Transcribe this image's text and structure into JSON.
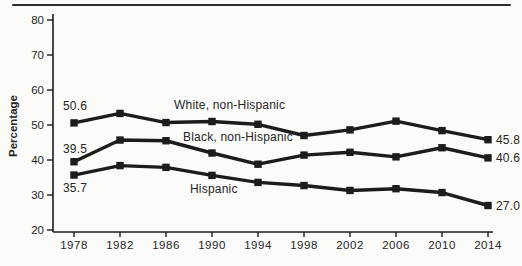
{
  "figure": {
    "background": "#fbfbf9",
    "rule_color": "#2d2d2d",
    "line_color": "#1c1c1c",
    "text_color": "#262626"
  },
  "chart_data": {
    "type": "line",
    "title": "",
    "xlabel": "",
    "ylabel": "Percentage",
    "ylim": [
      20,
      80
    ],
    "yticks": [
      "80",
      "70",
      "60",
      "50",
      "40",
      "30",
      "20"
    ],
    "categories": [
      "1978",
      "1982",
      "1986",
      "1990",
      "1994",
      "1998",
      "2002",
      "2006",
      "2010",
      "2014"
    ],
    "grid": false,
    "legend": "inline-labels",
    "marker": "filled-square",
    "series": [
      {
        "name": "White, non-Hispanic",
        "values": [
          50.6,
          53.3,
          50.7,
          51.0,
          50.2,
          47.0,
          48.6,
          51.1,
          48.4,
          45.8
        ],
        "first_label": "50.6",
        "last_label": "45.8"
      },
      {
        "name": "Black, non-Hispanic",
        "values": [
          39.5,
          45.7,
          45.5,
          42.0,
          38.8,
          41.4,
          42.2,
          40.9,
          43.5,
          40.6
        ],
        "first_label": "39.5",
        "last_label": "40.6"
      },
      {
        "name": "Hispanic",
        "values": [
          35.7,
          38.4,
          37.9,
          35.6,
          33.6,
          32.7,
          31.3,
          31.8,
          30.7,
          27.0
        ],
        "first_label": "35.7",
        "last_label": "27.0"
      }
    ]
  }
}
